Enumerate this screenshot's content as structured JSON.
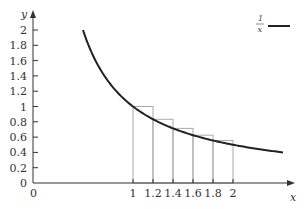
{
  "chart_data": {
    "type": "line",
    "title": "",
    "xlabel": "x",
    "ylabel": "y",
    "xlim": [
      0,
      2.5
    ],
    "ylim": [
      0,
      2
    ],
    "grid": false,
    "legend_position": "top-right",
    "x_ticks": [
      {
        "value": 0,
        "label": "0"
      },
      {
        "value": 1,
        "label": "1"
      },
      {
        "value": 1.2,
        "label": "1.2"
      },
      {
        "value": 1.4,
        "label": "1.4"
      },
      {
        "value": 1.6,
        "label": "1.6"
      },
      {
        "value": 1.8,
        "label": "1.8"
      },
      {
        "value": 2,
        "label": "2"
      }
    ],
    "y_ticks": [
      {
        "value": 0,
        "label": "0"
      },
      {
        "value": 0.2,
        "label": "0.2"
      },
      {
        "value": 0.4,
        "label": "0.4"
      },
      {
        "value": 0.6,
        "label": "0.6"
      },
      {
        "value": 0.8,
        "label": "0.8"
      },
      {
        "value": 1,
        "label": "1"
      },
      {
        "value": 1.2,
        "label": "1.2"
      },
      {
        "value": 1.4,
        "label": "1.4"
      },
      {
        "value": 1.6,
        "label": "1.6"
      },
      {
        "value": 1.8,
        "label": "1.8"
      },
      {
        "value": 2,
        "label": "2"
      }
    ],
    "series": [
      {
        "name": "1/x",
        "legend_numerator": "1",
        "legend_denominator": "x",
        "type": "line",
        "function": "1/x",
        "x_range": [
          0.5,
          2.5
        ],
        "color": "#222222"
      },
      {
        "name": "left Riemann rectangles",
        "type": "bar",
        "color": "#aaaaaa",
        "width": 0.2,
        "x": [
          1.0,
          1.2,
          1.4,
          1.6,
          1.8
        ],
        "values": [
          1.0,
          0.833,
          0.714,
          0.625,
          0.556
        ]
      }
    ]
  }
}
